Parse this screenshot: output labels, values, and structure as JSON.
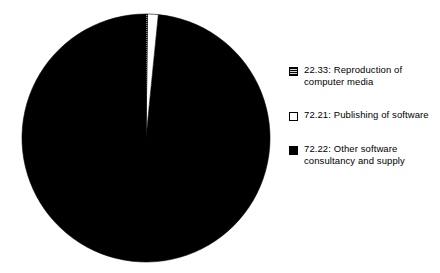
{
  "chart_data": {
    "type": "pie",
    "title": "",
    "subtitle": "",
    "xlabel": "",
    "ylabel": "",
    "grid": false,
    "legend_position": "right",
    "categories": [
      "22.33: Reproduction of computer media",
      "72.21: Publishing of software",
      "72.22: Other software consultancy and supply"
    ],
    "values": [
      0.2,
      1.4,
      98.4
    ],
    "value_unit": "percent",
    "start_angle_deg": 0,
    "direction": "clockwise",
    "slices": [
      {
        "code": "22.33",
        "name": "Reproduction of computer media",
        "label": "22.33: Reproduction of\ncomputer media",
        "value": 0.2,
        "angle_deg": 0.7,
        "fill": "hatch",
        "color": "#4a4a4a"
      },
      {
        "code": "72.21",
        "name": "Publishing of software",
        "label": "72.21: Publishing of software",
        "value": 1.4,
        "angle_deg": 5.0,
        "fill": "open",
        "color": "#ffffff"
      },
      {
        "code": "72.22",
        "name": "Other software consultancy and supply",
        "label": "72.22: Other software\nconsultancy and supply",
        "value": 98.4,
        "angle_deg": 354.3,
        "fill": "solid",
        "color": "#000000"
      }
    ]
  },
  "pie": {
    "center_x": 146,
    "center_y": 138,
    "radius": 124,
    "outline_color": "#000000"
  },
  "legend": {
    "items": [
      {
        "swatch": "hatch-swatch",
        "label": "22.33: Reproduction of\ncomputer media"
      },
      {
        "swatch": "open-swatch",
        "label": "72.21: Publishing of software"
      },
      {
        "swatch": "solid-swatch",
        "label": "72.22: Other software\nconsultancy and supply"
      }
    ]
  },
  "colors": {
    "background": "#ffffff",
    "foreground": "#000000",
    "hatch": "#4a4a4a"
  }
}
